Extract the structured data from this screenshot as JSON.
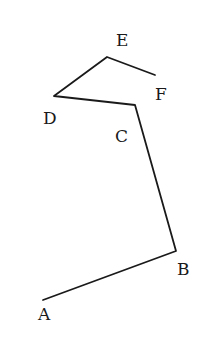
{
  "diagram": {
    "type": "polyline",
    "points": [
      {
        "name": "A",
        "x": 43,
        "y": 300,
        "label_x": 38,
        "label_y": 320
      },
      {
        "name": "B",
        "x": 176,
        "y": 251,
        "label_x": 177,
        "label_y": 275
      },
      {
        "name": "C",
        "x": 135,
        "y": 105,
        "label_x": 115,
        "label_y": 142
      },
      {
        "name": "D",
        "x": 54,
        "y": 96,
        "label_x": 43,
        "label_y": 124
      },
      {
        "name": "E",
        "x": 107,
        "y": 57,
        "label_x": 116,
        "label_y": 46
      },
      {
        "name": "F",
        "x": 155,
        "y": 75,
        "label_x": 155,
        "label_y": 100
      }
    ],
    "labels": {
      "A": "A",
      "B": "B",
      "C": "C",
      "D": "D",
      "E": "E",
      "F": "F"
    },
    "segments": [
      "AB",
      "BC",
      "CD",
      "DE",
      "EF"
    ],
    "stroke_color": "#1a1a1a",
    "background": "#ffffff"
  }
}
